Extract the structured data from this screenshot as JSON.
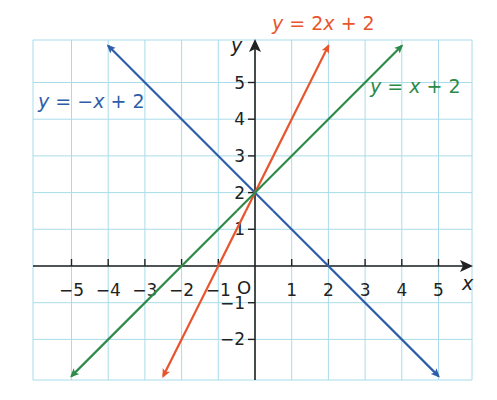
{
  "chart_data": {
    "type": "line",
    "title": "",
    "xlabel": "x",
    "ylabel": "y",
    "origin_label": "O",
    "xlim": [
      -6,
      6
    ],
    "ylim": [
      -3,
      6
    ],
    "x_ticks": [
      -5,
      -4,
      -3,
      -2,
      -1,
      1,
      2,
      3,
      4,
      5
    ],
    "y_ticks": [
      -2,
      -1,
      1,
      2,
      3,
      4,
      5
    ],
    "grid": true,
    "series": [
      {
        "name": "y = -x + 2",
        "label_text": "y = −x + 2",
        "slope": -1,
        "intercept": 2,
        "color": "#2e5ea8",
        "x": [
          -4,
          5
        ],
        "y": [
          6,
          -3
        ]
      },
      {
        "name": "y = 2x + 2",
        "label_text": "y = 2x + 2",
        "slope": 2,
        "intercept": 2,
        "color": "#e8552c",
        "x": [
          -2.5,
          2
        ],
        "y": [
          -3,
          6
        ]
      },
      {
        "name": "y = x + 2",
        "label_text": "y = x + 2",
        "slope": 1,
        "intercept": 2,
        "color": "#2e8a48",
        "x": [
          -5,
          4
        ],
        "y": [
          -3,
          6
        ]
      }
    ],
    "intersection": {
      "x": 0,
      "y": 2
    }
  },
  "colors": {
    "grid": "#a8dcea",
    "axis": "#222222"
  }
}
